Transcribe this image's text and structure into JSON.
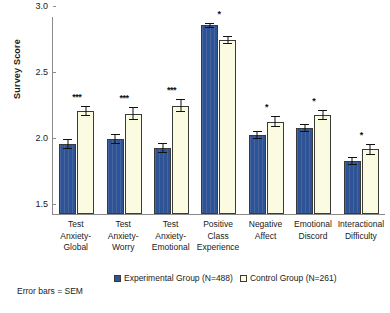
{
  "chart_data": {
    "type": "bar",
    "title": "",
    "xlabel": "",
    "ylabel": "Survey Score",
    "ylim": [
      1.5,
      3.0
    ],
    "yticks": [
      "1.5",
      "2.0",
      "2.5",
      "3.0"
    ],
    "grid": false,
    "legend_position": "bottom",
    "categories": [
      "Test Anxiety-Global",
      "Test Anxiety-Worry",
      "Test Anxiety-Emotional",
      "Positive Class Experience",
      "Negative Affect",
      "Emotional Discord",
      "Interactional Difficulty"
    ],
    "category_lines": [
      [
        "Test",
        "Anxiety-",
        "Global"
      ],
      [
        "Test",
        "Anxiety-",
        "Worry"
      ],
      [
        "Test",
        "Anxiety-",
        "Emotional"
      ],
      [
        "Positive",
        "Class",
        "Experience"
      ],
      [
        "Negative",
        "Affect"
      ],
      [
        "Emotional",
        "Discord"
      ],
      [
        "Interactional",
        "Difficulty"
      ]
    ],
    "series": [
      {
        "name": "Experimental Group (N=488)",
        "color": "#2f5496",
        "values": [
          2.03,
          2.07,
          2.0,
          2.93,
          2.1,
          2.15,
          1.9
        ],
        "errors": [
          0.04,
          0.04,
          0.04,
          0.02,
          0.03,
          0.03,
          0.03
        ]
      },
      {
        "name": "Control Group (N=261)",
        "color": "#fbfbe2",
        "values": [
          2.28,
          2.26,
          2.32,
          2.82,
          2.2,
          2.25,
          1.99
        ],
        "errors": [
          0.04,
          0.05,
          0.05,
          0.03,
          0.04,
          0.04,
          0.04
        ]
      }
    ],
    "significance": [
      "***",
      "***",
      "***",
      "*",
      "*",
      "*",
      "*"
    ],
    "footnote": "Error bars = SEM"
  },
  "legend": {
    "items": [
      {
        "label": "Experimental Group (N=488)"
      },
      {
        "label": "Control Group (N=261)"
      }
    ]
  }
}
